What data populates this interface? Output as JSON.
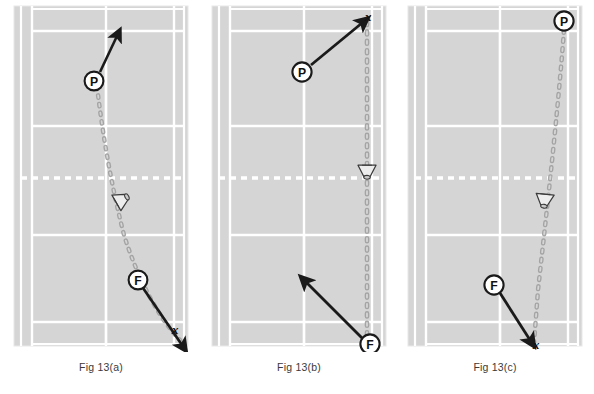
{
  "figure": {
    "background_color": "#ffffff",
    "court_surface_color": "#d5d5d5",
    "court_line_color": "#ffffff",
    "net_line_color": "#ffffff",
    "marker_ink_color": "#1a1a1a",
    "shuttle_path_color": "#9a9a9a"
  },
  "panels": [
    {
      "id": "panel-a",
      "caption": "Fig 13(a)",
      "player_marker": {
        "label": "P",
        "position": "mid-upper-court-center",
        "x": 96,
        "y": 81
      },
      "player_arrow": {
        "from": [
          100,
          78
        ],
        "to": [
          118,
          40
        ],
        "direction": "up-right",
        "present": true
      },
      "feeder_marker": {
        "label": "F",
        "position": "lower-court-center-right",
        "x": 140,
        "y": 280
      },
      "feeder_arrow": {
        "from": [
          146,
          288
        ],
        "to": [
          182,
          345
        ],
        "direction": "down-right",
        "present": true
      },
      "landing_mark": {
        "label": "x",
        "x": 176,
        "y": 329
      },
      "shuttle_icon": {
        "x": 108,
        "y": 205,
        "rotation": -28
      },
      "trajectory": "diagonal-from-upper-left-to-lower-right",
      "shuttle_path_points": [
        [
          96,
          86
        ],
        [
          104,
          140
        ],
        [
          112,
          185
        ],
        [
          122,
          240
        ],
        [
          140,
          290
        ],
        [
          176,
          338
        ]
      ]
    },
    {
      "id": "panel-b",
      "caption": "Fig 13(b)",
      "player_marker": {
        "label": "P",
        "position": "upper-court-center",
        "x": 302,
        "y": 72
      },
      "player_arrow": {
        "from": [
          310,
          66
        ],
        "to": [
          364,
          22
        ],
        "direction": "up-right",
        "present": true
      },
      "feeder_marker": {
        "label": "F",
        "position": "bottom-right-corner",
        "x": 370,
        "y": 344
      },
      "feeder_arrow": {
        "from": [
          364,
          338
        ],
        "to": [
          305,
          281
        ],
        "direction": "up-left",
        "present": true
      },
      "landing_mark": {
        "label": "x",
        "x": 368,
        "y": 17
      },
      "shuttle_icon": {
        "x": 366,
        "y": 165,
        "rotation": 0
      },
      "trajectory": "straight-vertical-along-right-sideline",
      "shuttle_path_points": [
        [
          367,
          26
        ],
        [
          367,
          100
        ],
        [
          367,
          160
        ],
        [
          367,
          240
        ],
        [
          367,
          330
        ]
      ]
    },
    {
      "id": "panel-c",
      "caption": "Fig 13(c)",
      "player_marker": {
        "label": "P",
        "position": "top-right-corner",
        "x": 564,
        "y": 21
      },
      "player_arrow": {
        "present": false
      },
      "feeder_marker": {
        "label": "F",
        "position": "lower-court-center",
        "x": 494,
        "y": 285
      },
      "feeder_arrow": {
        "from": [
          500,
          293
        ],
        "to": [
          530,
          338
        ],
        "direction": "down-right",
        "present": true
      },
      "landing_mark": {
        "label": "x",
        "x": 533,
        "y": 345
      },
      "shuttle_icon": {
        "x": 540,
        "y": 200,
        "rotation": 0
      },
      "trajectory": "near-vertical-along-right-side",
      "shuttle_path_points": [
        [
          564,
          30
        ],
        [
          558,
          110
        ],
        [
          550,
          180
        ],
        [
          543,
          250
        ],
        [
          537,
          320
        ],
        [
          533,
          342
        ]
      ]
    }
  ],
  "court_geometry": {
    "note": "Standard badminton court viewed from above; net shown as white dotted line across middle.",
    "lines": [
      {
        "name": "outer-doubles-sideline-left",
        "orientation": "vertical"
      },
      {
        "name": "singles-sideline-left",
        "orientation": "vertical"
      },
      {
        "name": "centre-line",
        "orientation": "vertical"
      },
      {
        "name": "singles-sideline-right",
        "orientation": "vertical"
      },
      {
        "name": "outer-doubles-sideline-right",
        "orientation": "vertical"
      },
      {
        "name": "top-doubles-long-service-line",
        "orientation": "horizontal"
      },
      {
        "name": "top-baseline",
        "orientation": "horizontal"
      },
      {
        "name": "top-short-service-line",
        "orientation": "horizontal"
      },
      {
        "name": "net",
        "orientation": "horizontal",
        "style": "dotted"
      },
      {
        "name": "bottom-short-service-line",
        "orientation": "horizontal"
      },
      {
        "name": "bottom-doubles-long-service-line",
        "orientation": "horizontal"
      },
      {
        "name": "bottom-baseline",
        "orientation": "horizontal"
      }
    ]
  },
  "legend": {
    "P": "Player",
    "F": "Feeder",
    "x": "Shuttle landing point",
    "shuttle": "Shuttlecock in flight"
  }
}
